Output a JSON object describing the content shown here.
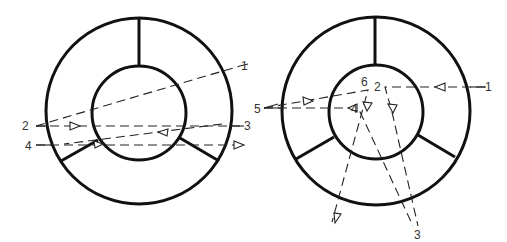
{
  "colors": {
    "stroke": "#111111",
    "ray": "#222222",
    "label": "#333333",
    "background": "#ffffff"
  },
  "diagrams": [
    {
      "name": "left-ring",
      "outer": {
        "cx": 139,
        "cy": 111,
        "r": 93
      },
      "inner": {
        "cx": 139,
        "cy": 113,
        "r": 47
      },
      "spokes": [
        {
          "x1": 139,
          "y1": 18,
          "x2": 139,
          "y2": 66
        },
        {
          "x1": 61,
          "y1": 161,
          "x2": 98,
          "y2": 140
        },
        {
          "x1": 219,
          "y1": 161,
          "x2": 180,
          "y2": 138
        }
      ],
      "rays": [
        {
          "id": "1",
          "d": "M 36 126 L 240 66"
        },
        {
          "id": "2",
          "d": "M 36 126 L 240 126"
        },
        {
          "id": "3",
          "d": "M 222 124 L 64 144"
        },
        {
          "id": "4",
          "d": "M 36 145 L 244 145"
        }
      ],
      "leads": [
        {
          "d": "M 240 66 L 248 64"
        },
        {
          "d": "M 230 126 L 244 126"
        },
        {
          "d": "M 36 145 L 52 145"
        },
        {
          "d": "M 36 126 L 48 126"
        }
      ],
      "arrows": [
        {
          "d": "M 70 122 L 80 126 L 70 130 Z"
        },
        {
          "d": "M 168 129 L 158 132 L 167 136 Z"
        },
        {
          "d": "M 94 141 L 103 144 L 95 148 Z"
        },
        {
          "d": "M 234 141 L 244 145 L 234 149 Z"
        }
      ],
      "labels": [
        {
          "text": "1",
          "x": 241,
          "y": 70
        },
        {
          "text": "2",
          "x": 22,
          "y": 130
        },
        {
          "text": "3",
          "x": 244,
          "y": 130
        },
        {
          "text": "4",
          "x": 25,
          "y": 150
        }
      ]
    },
    {
      "name": "right-ring",
      "outer": {
        "cx": 376,
        "cy": 111,
        "r": 94
      },
      "inner": {
        "cx": 376,
        "cy": 112,
        "r": 47
      },
      "spokes": [
        {
          "x1": 375,
          "y1": 17,
          "x2": 375,
          "y2": 65
        },
        {
          "x1": 296,
          "y1": 159,
          "x2": 334,
          "y2": 137
        },
        {
          "x1": 455,
          "y1": 157,
          "x2": 418,
          "y2": 135
        }
      ],
      "rays": [
        {
          "id": "1",
          "d": "M 485 87 L 385 87 L 392 112 L 418 226"
        },
        {
          "id": "5-upper",
          "d": "M 264 108 L 368 90 L 332 222"
        },
        {
          "id": "5-lower",
          "d": "M 264 108 L 358 108 L 362 116 L 413 226"
        }
      ],
      "leads": [
        {
          "d": "M 264 108 L 278 104"
        },
        {
          "d": "M 264 108 L 282 108"
        },
        {
          "d": "M 470 87 L 486 87"
        }
      ],
      "arrows": [
        {
          "d": "M 303 97 L 313 101 L 304 105 Z"
        },
        {
          "d": "M 357 104 L 348 108 L 357 112 Z"
        },
        {
          "d": "M 445 83 L 435 87 L 445 91 Z"
        },
        {
          "d": "M 363 102 L 367 111 L 372 103 Z"
        },
        {
          "d": "M 388 104 L 393 113 L 397 105 Z"
        },
        {
          "d": "M 334 213 L 335 223 L 341 214 Z"
        }
      ],
      "labels": [
        {
          "text": "1",
          "x": 485,
          "y": 91
        },
        {
          "text": "2",
          "x": 374,
          "y": 91
        },
        {
          "text": "3",
          "x": 414,
          "y": 239
        },
        {
          "text": "4",
          "x": 351,
          "y": 113
        },
        {
          "text": "5",
          "x": 254,
          "y": 113
        },
        {
          "text": "6",
          "x": 361,
          "y": 86
        }
      ]
    }
  ]
}
